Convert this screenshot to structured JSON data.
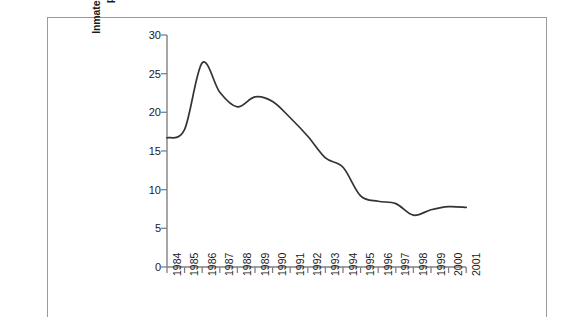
{
  "chart_data": {
    "type": "line",
    "title": "",
    "subtitle": "",
    "xlabel": "",
    "ylabel": "Inmates in Protective Custody\nper 1,000 Inmates",
    "ylabel_lines": [
      "Inmates in Protective Custody",
      "per 1,000 Inmates"
    ],
    "categories": [
      "1984",
      "1985",
      "1986",
      "1987",
      "1988",
      "1989",
      "1990",
      "1991",
      "1992",
      "1993",
      "1994",
      "1995",
      "1996",
      "1997",
      "1998",
      "1999",
      "2000",
      "2001"
    ],
    "x": [
      1984,
      1985,
      1986,
      1987,
      1988,
      1989,
      1990,
      1991,
      1992,
      1993,
      1994,
      1995,
      1996,
      1997,
      1998,
      1999,
      2000,
      2001
    ],
    "values": [
      16.7,
      17.8,
      26.4,
      22.6,
      20.7,
      22.0,
      21.4,
      19.3,
      16.9,
      14.1,
      12.9,
      9.2,
      8.5,
      8.2,
      6.7,
      7.4,
      7.8,
      7.7
    ],
    "series": [
      {
        "name": "Inmates in Protective Custody per 1,000 Inmates",
        "values": [
          16.7,
          17.8,
          26.4,
          22.6,
          20.7,
          22.0,
          21.4,
          19.3,
          16.9,
          14.1,
          12.9,
          9.2,
          8.5,
          8.2,
          6.7,
          7.4,
          7.8,
          7.7
        ],
        "color": "#333333"
      }
    ],
    "ylim": [
      0,
      30
    ],
    "yticks": [
      0,
      5,
      10,
      15,
      20,
      25,
      30
    ],
    "ytick_labels": [
      "0",
      "5",
      "10",
      "15",
      "20",
      "25",
      "30"
    ],
    "xlim": [
      1984,
      2001
    ],
    "grid": false,
    "legend": false,
    "legend_position": "none",
    "annotations": [],
    "line_color": "#333333",
    "axis_color": "#808080",
    "background_color": "#ffffff"
  },
  "figure": {
    "frame_color": "#9a9a9a"
  }
}
